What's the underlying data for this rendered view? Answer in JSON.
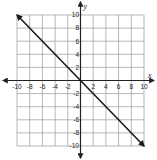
{
  "chart_data": {
    "type": "line",
    "title": "",
    "xlabel": "x",
    "ylabel": "y",
    "xlim": [
      -10,
      10
    ],
    "ylim": [
      -10,
      10
    ],
    "grid": true,
    "grid_step": 2,
    "x_ticks": [
      -10,
      -8,
      -6,
      -4,
      -2,
      2,
      4,
      6,
      8,
      10
    ],
    "y_ticks": [
      -10,
      -8,
      -6,
      -4,
      -2,
      2,
      4,
      6,
      8,
      10
    ],
    "series": [
      {
        "name": "line",
        "x": [
          -10,
          10
        ],
        "y": [
          10,
          -10
        ],
        "arrows": "both",
        "color": "#1a1a1a"
      }
    ],
    "legend": null
  },
  "colors": {
    "grid": "#9a9a9a",
    "axis": "#222222",
    "line": "#1a1a1a"
  }
}
